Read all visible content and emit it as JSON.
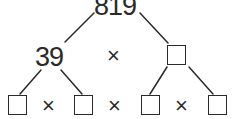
{
  "diagram": {
    "type": "factor-tree",
    "root": {
      "value": "819"
    },
    "level1": {
      "left": {
        "value": "39"
      },
      "operator": "×",
      "right": {
        "value": "",
        "shape": "empty-box"
      }
    },
    "level2": {
      "items": [
        {
          "value": "",
          "shape": "empty-box"
        },
        {
          "value": "",
          "shape": "empty-box"
        },
        {
          "value": "",
          "shape": "empty-box"
        },
        {
          "value": "",
          "shape": "empty-box"
        }
      ],
      "operators": [
        "×",
        "×",
        "×"
      ]
    },
    "line_color": "#2a2a2a"
  }
}
